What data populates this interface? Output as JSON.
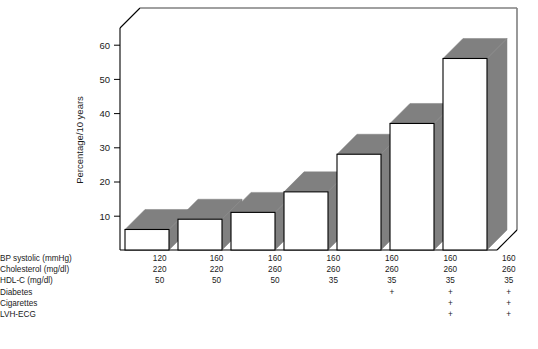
{
  "chart_data": {
    "type": "bar",
    "title": "",
    "xlabel": "",
    "ylabel": "Percentage/10 years",
    "ylim": [
      0,
      65
    ],
    "yticks": [
      10,
      20,
      30,
      40,
      50,
      60
    ],
    "grid": false,
    "legend": false,
    "style": "3d-bar",
    "categories": [
      "1",
      "2",
      "3",
      "4",
      "5",
      "6",
      "7"
    ],
    "values": [
      6,
      9,
      11,
      17,
      28,
      37,
      56
    ],
    "bar_colors": {
      "front": "#ffffff",
      "shade": "#808080",
      "outline": "#000000"
    },
    "risk_factor_table": {
      "row_labels": [
        "BP systolic (mmHg)",
        "Cholesterol (mg/dl)",
        "HDL-C (mg/dl)",
        "Diabetes",
        "Cigarettes",
        "LVH-ECG"
      ],
      "columns": [
        {
          "bp_systolic": "120",
          "cholesterol": "220",
          "hdl_c": "50",
          "diabetes": "",
          "cigarettes": "",
          "lvh_ecg": ""
        },
        {
          "bp_systolic": "160",
          "cholesterol": "220",
          "hdl_c": "50",
          "diabetes": "",
          "cigarettes": "",
          "lvh_ecg": ""
        },
        {
          "bp_systolic": "160",
          "cholesterol": "260",
          "hdl_c": "50",
          "diabetes": "",
          "cigarettes": "",
          "lvh_ecg": ""
        },
        {
          "bp_systolic": "160",
          "cholesterol": "260",
          "hdl_c": "35",
          "diabetes": "",
          "cigarettes": "",
          "lvh_ecg": ""
        },
        {
          "bp_systolic": "160",
          "cholesterol": "260",
          "hdl_c": "35",
          "diabetes": "+",
          "cigarettes": "",
          "lvh_ecg": ""
        },
        {
          "bp_systolic": "160",
          "cholesterol": "260",
          "hdl_c": "35",
          "diabetes": "+",
          "cigarettes": "+",
          "lvh_ecg": "+"
        },
        {
          "bp_systolic": "160",
          "cholesterol": "260",
          "hdl_c": "35",
          "diabetes": "+",
          "cigarettes": "+",
          "lvh_ecg": "+"
        }
      ]
    }
  },
  "axis": {
    "ylabel": "Percentage/10 years",
    "tick_60": "60",
    "tick_50": "50",
    "tick_40": "40",
    "tick_30": "30",
    "tick_20": "20",
    "tick_10": "10"
  },
  "table": {
    "labels": {
      "bp": "BP systolic (mmHg)",
      "chol": "Cholesterol (mg/dl)",
      "hdl": "HDL-C (mg/dl)",
      "diabetes": "Diabetes",
      "cigarettes": "Cigarettes",
      "lvh": "LVH-ECG"
    },
    "bp": [
      "120",
      "160",
      "160",
      "160",
      "160",
      "160",
      "160"
    ],
    "chol": [
      "220",
      "220",
      "260",
      "260",
      "260",
      "260",
      "260"
    ],
    "hdl": [
      "50",
      "50",
      "50",
      "35",
      "35",
      "35",
      "35"
    ],
    "diabetes": [
      "",
      "",
      "",
      "",
      "+",
      "+",
      "+"
    ],
    "cigarettes": [
      "",
      "",
      "",
      "",
      "",
      "+",
      "+"
    ],
    "lvh": [
      "",
      "",
      "",
      "",
      "",
      "+",
      "+"
    ]
  }
}
